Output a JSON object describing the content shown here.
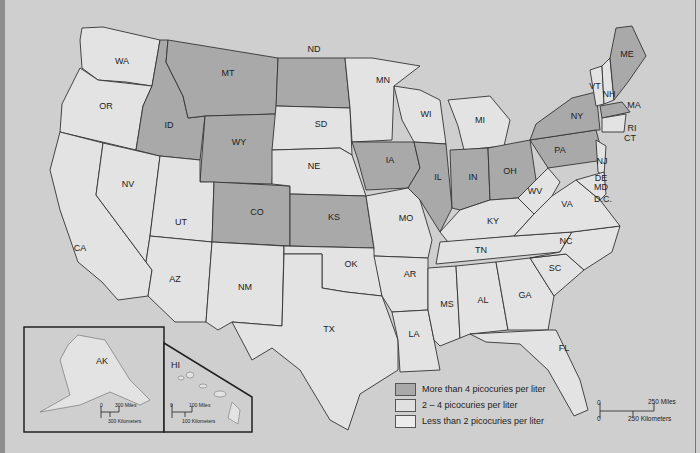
{
  "map": {
    "title": "",
    "colors": {
      "high": "#a9a9a9",
      "mid": "#c4c4c4",
      "low": "#e3e3e3",
      "water": "#cfcfcf",
      "border": "#333333"
    },
    "states": [
      {
        "abbr": "WA",
        "x": 122,
        "y": 64,
        "level": "low"
      },
      {
        "abbr": "OR",
        "x": 106,
        "y": 109,
        "level": "low"
      },
      {
        "abbr": "CA",
        "x": 80,
        "y": 251,
        "level": "low"
      },
      {
        "abbr": "NV",
        "x": 128,
        "y": 187,
        "level": "low"
      },
      {
        "abbr": "ID",
        "x": 169,
        "y": 128,
        "level": "high"
      },
      {
        "abbr": "MT",
        "x": 228,
        "y": 76,
        "level": "high"
      },
      {
        "abbr": "WY",
        "x": 239,
        "y": 145,
        "level": "high"
      },
      {
        "abbr": "UT",
        "x": 181,
        "y": 225,
        "level": "low"
      },
      {
        "abbr": "AZ",
        "x": 175,
        "y": 282,
        "level": "low"
      },
      {
        "abbr": "CO",
        "x": 257,
        "y": 215,
        "level": "high"
      },
      {
        "abbr": "NM",
        "x": 245,
        "y": 290,
        "level": "low"
      },
      {
        "abbr": "ND",
        "x": 314,
        "y": 52,
        "level": "high"
      },
      {
        "abbr": "SD",
        "x": 321,
        "y": 127,
        "level": "high"
      },
      {
        "abbr": "NE",
        "x": 314,
        "y": 169,
        "level": "low"
      },
      {
        "abbr": "KS",
        "x": 334,
        "y": 220,
        "level": "high"
      },
      {
        "abbr": "OK",
        "x": 351,
        "y": 267,
        "level": "low"
      },
      {
        "abbr": "TX",
        "x": 329,
        "y": 332,
        "level": "low"
      },
      {
        "abbr": "MN",
        "x": 383,
        "y": 83,
        "level": "high"
      },
      {
        "abbr": "IA",
        "x": 390,
        "y": 163,
        "level": "high"
      },
      {
        "abbr": "MO",
        "x": 406,
        "y": 221,
        "level": "low"
      },
      {
        "abbr": "AR",
        "x": 410,
        "y": 277,
        "level": "low"
      },
      {
        "abbr": "LA",
        "x": 414,
        "y": 337,
        "level": "low"
      },
      {
        "abbr": "WI",
        "x": 426,
        "y": 117,
        "level": "low"
      },
      {
        "abbr": "IL",
        "x": 438,
        "y": 180,
        "level": "high"
      },
      {
        "abbr": "MI",
        "x": 480,
        "y": 123,
        "level": "low"
      },
      {
        "abbr": "IN",
        "x": 473,
        "y": 180,
        "level": "high"
      },
      {
        "abbr": "OH",
        "x": 510,
        "y": 174,
        "level": "high"
      },
      {
        "abbr": "KY",
        "x": 493,
        "y": 224,
        "level": "low"
      },
      {
        "abbr": "TN",
        "x": 481,
        "y": 253,
        "level": "low"
      },
      {
        "abbr": "MS",
        "x": 447,
        "y": 307,
        "level": "low"
      },
      {
        "abbr": "AL",
        "x": 483,
        "y": 303,
        "level": "low"
      },
      {
        "abbr": "GA",
        "x": 525,
        "y": 298,
        "level": "low"
      },
      {
        "abbr": "FL",
        "x": 564,
        "y": 351,
        "level": "low"
      },
      {
        "abbr": "SC",
        "x": 555,
        "y": 271,
        "level": "low"
      },
      {
        "abbr": "NC",
        "x": 566,
        "y": 244,
        "level": "low"
      },
      {
        "abbr": "VA",
        "x": 567,
        "y": 207,
        "level": "low"
      },
      {
        "abbr": "WV",
        "x": 535,
        "y": 194,
        "level": "low"
      },
      {
        "abbr": "PA",
        "x": 560,
        "y": 153,
        "level": "high"
      },
      {
        "abbr": "NY",
        "x": 577,
        "y": 119,
        "level": "high"
      },
      {
        "abbr": "NJ",
        "x": 602,
        "y": 164,
        "level": "low"
      },
      {
        "abbr": "DE",
        "x": 601,
        "y": 181,
        "level": "low"
      },
      {
        "abbr": "MD",
        "x": 601,
        "y": 190,
        "level": "low"
      },
      {
        "abbr": "D.C.",
        "x": 603,
        "y": 202,
        "level": "low"
      },
      {
        "abbr": "VT",
        "x": 595,
        "y": 89,
        "level": "low"
      },
      {
        "abbr": "NH",
        "x": 609,
        "y": 97,
        "level": "low"
      },
      {
        "abbr": "ME",
        "x": 627,
        "y": 57,
        "level": "high"
      },
      {
        "abbr": "MA",
        "x": 634,
        "y": 108,
        "level": "high"
      },
      {
        "abbr": "RI",
        "x": 632,
        "y": 131,
        "level": "low"
      },
      {
        "abbr": "CT",
        "x": 630,
        "y": 141,
        "level": "low"
      }
    ],
    "insets": {
      "alaska": {
        "label": "AK",
        "scale_miles": "300 Miles",
        "scale_km": "300 Kilometers",
        "zero": "0"
      },
      "hawaii": {
        "label": "HI",
        "scale_miles": "100 Miles",
        "scale_km": "100 Kilometers",
        "zero": "0"
      }
    },
    "legend": [
      {
        "label": "More than 4 picocuries per liter",
        "level": "high"
      },
      {
        "label": "2 –  4 picocuries per liter",
        "level": "mid"
      },
      {
        "label": "Less than 2 picocuries per liter",
        "level": "low"
      }
    ],
    "scale": {
      "zero": "0",
      "miles": "250 Miles",
      "km": "250 Kilometers"
    }
  }
}
